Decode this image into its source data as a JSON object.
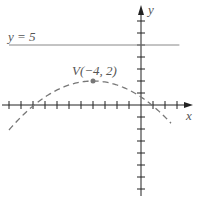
{
  "chart_data": {
    "type": "line",
    "title": "",
    "xlabel": "x",
    "ylabel": "y",
    "xlim": [
      -11.5,
      3.5
    ],
    "ylim": [
      -7.5,
      8.5
    ],
    "grid": false,
    "x_ticks": [
      -11,
      -10,
      -9,
      -8,
      -7,
      -6,
      -5,
      -4,
      -3,
      -2,
      -1,
      1,
      2,
      3
    ],
    "y_ticks": [
      -7,
      -6,
      -5,
      -4,
      -3,
      -2,
      -1,
      1,
      2,
      3,
      4,
      5,
      6,
      7
    ],
    "series": [
      {
        "name": "parabola",
        "style": "dashed",
        "equation": "(x+4)^2 = -12(y-2)",
        "vertex": [
          -4,
          2
        ],
        "x_range": [
          -11,
          2.5
        ]
      },
      {
        "name": "directrix",
        "style": "solid",
        "equation": "y = 5",
        "x_range": [
          -11,
          3.2
        ]
      }
    ],
    "annotations": [
      {
        "text": "y = 5",
        "x": -11,
        "y": 5.4
      },
      {
        "text": "V(−4, 2)",
        "x": -6.8,
        "y": 2.6
      },
      {
        "text": "vertex-point",
        "x": -4,
        "y": 2
      }
    ],
    "colors": {
      "axis": "#222222",
      "curve": "#777777",
      "text": "#555555"
    }
  }
}
